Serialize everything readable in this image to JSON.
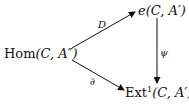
{
  "diagram": {
    "nodes": {
      "hom": {
        "func": "Hom",
        "args": "(C, A″)"
      },
      "e": {
        "func": "e",
        "args": "(C, A′)"
      },
      "ext": {
        "func": "Ext",
        "sup": "1",
        "args": "(C, A′)"
      }
    },
    "arrows": {
      "D": {
        "label": "D",
        "from": "hom",
        "to": "e"
      },
      "partial": {
        "label": "∂",
        "from": "hom",
        "to": "ext"
      },
      "psi": {
        "label": "ψ",
        "from": "e",
        "to": "ext"
      }
    }
  }
}
